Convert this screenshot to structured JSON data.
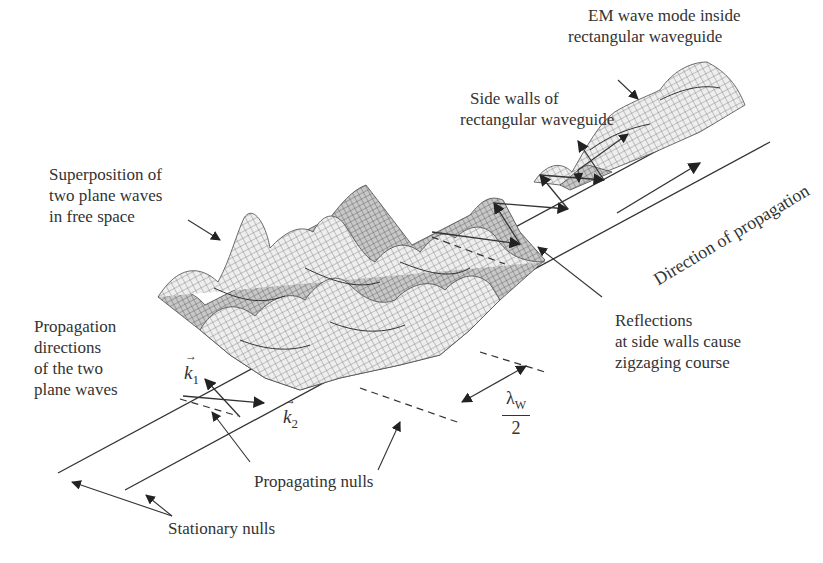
{
  "diagram": {
    "type": "physics-illustration",
    "colors": {
      "lines": "#333333",
      "mesh": "#555555",
      "background": "#ffffff"
    }
  },
  "labels": {
    "em_mode": [
      "EM wave mode inside",
      "rectangular waveguide"
    ],
    "side_walls": [
      "Side walls of",
      "rectangular waveguide"
    ],
    "superposition": [
      "Superposition of",
      "two plane waves",
      "in free space"
    ],
    "direction": "Direction of propagation",
    "propagation_dirs": [
      "Propagation",
      "directions",
      "of the two",
      "plane waves"
    ],
    "reflections": [
      "Reflections",
      "at side walls cause",
      "zigzaging course"
    ],
    "propagating_nulls": "Propagating nulls",
    "stationary_nulls": "Stationary nulls",
    "k1": {
      "symbol": "k",
      "subscript": "1"
    },
    "k2": {
      "symbol": "k",
      "subscript": "2"
    },
    "lambda": {
      "symbol": "λ",
      "subscript": "W",
      "denominator": "2"
    }
  }
}
